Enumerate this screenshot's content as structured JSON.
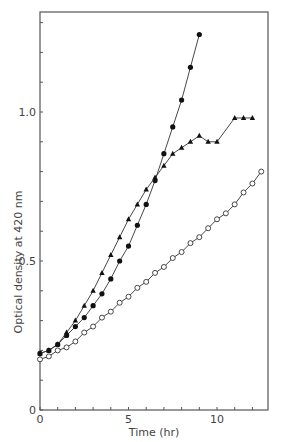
{
  "chart_data": {
    "type": "line",
    "title": "",
    "xlabel": "Time (hr)",
    "ylabel": "Optical density at 420 nm",
    "xlim": [
      0,
      12.8
    ],
    "ylim": [
      0,
      1.33
    ],
    "xticks": [
      0,
      5,
      10
    ],
    "xtick_labels": [
      "0",
      "5",
      "10"
    ],
    "yticks": [
      0,
      0.5,
      1.0
    ],
    "ytick_labels": [
      "0",
      "0.5",
      "1.0"
    ],
    "grid": false,
    "legend": null,
    "series": [
      {
        "name": "filled circles",
        "marker": "filled-circle",
        "x": [
          0,
          0.5,
          1,
          1.5,
          2,
          2.5,
          3,
          3.5,
          4,
          4.5,
          5,
          5.5,
          6,
          6.5,
          7,
          7.5,
          8,
          8.5,
          9
        ],
        "y": [
          0.19,
          0.2,
          0.22,
          0.25,
          0.28,
          0.31,
          0.35,
          0.39,
          0.44,
          0.5,
          0.55,
          0.62,
          0.69,
          0.77,
          0.86,
          0.95,
          1.04,
          1.15,
          1.26
        ]
      },
      {
        "name": "filled triangles",
        "marker": "filled-triangle",
        "x": [
          0,
          0.5,
          1,
          1.5,
          2,
          2.5,
          3,
          3.5,
          4,
          4.5,
          5,
          5.5,
          6,
          6.5,
          7,
          7.5,
          8,
          8.5,
          9,
          9.5,
          10,
          11,
          11.5,
          12
        ],
        "y": [
          0.19,
          0.2,
          0.22,
          0.26,
          0.3,
          0.35,
          0.4,
          0.46,
          0.52,
          0.58,
          0.64,
          0.69,
          0.74,
          0.78,
          0.82,
          0.86,
          0.88,
          0.9,
          0.92,
          0.9,
          0.9,
          0.98,
          0.98,
          0.98
        ]
      },
      {
        "name": "open circles",
        "marker": "open-circle",
        "x": [
          0,
          0.5,
          1,
          1.5,
          2,
          2.5,
          3,
          3.5,
          4,
          4.5,
          5,
          5.5,
          6,
          6.5,
          7,
          7.5,
          8,
          8.5,
          9,
          9.5,
          10,
          10.5,
          11,
          11.5,
          12,
          12.5
        ],
        "y": [
          0.17,
          0.18,
          0.2,
          0.21,
          0.23,
          0.26,
          0.28,
          0.31,
          0.33,
          0.36,
          0.38,
          0.41,
          0.43,
          0.46,
          0.48,
          0.51,
          0.53,
          0.56,
          0.58,
          0.61,
          0.64,
          0.66,
          0.69,
          0.73,
          0.76,
          0.8
        ]
      }
    ]
  },
  "axes": {
    "x_title": "Time (hr)",
    "y_title": "Optical density at 420 nm"
  }
}
